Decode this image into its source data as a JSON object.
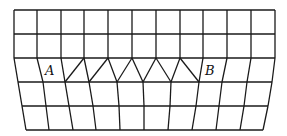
{
  "diagram": {
    "type": "mesh-grid",
    "labels": [
      {
        "id": "A",
        "text": "A",
        "x": 45,
        "y": 66
      },
      {
        "id": "B",
        "text": "B",
        "x": 205,
        "y": 66
      }
    ],
    "stroke_color": "#1a1a1a",
    "rows_y": [
      10,
      34,
      58,
      82,
      106,
      130
    ],
    "top_columns_x": [
      14,
      37,
      61,
      84,
      108,
      132,
      156,
      180,
      203,
      227,
      251,
      275
    ],
    "row82_x": [
      18,
      43,
      65,
      89,
      117,
      143,
      171,
      199,
      222,
      247,
      272
    ],
    "row106_x": [
      22,
      46,
      69,
      93,
      119,
      144,
      170,
      196,
      219,
      244,
      268
    ],
    "row130_x": [
      26,
      49,
      73,
      96,
      120,
      144,
      168,
      192,
      216,
      240,
      263
    ],
    "zigzag_apex_x": [
      84,
      108,
      132,
      156,
      180
    ],
    "zigzag_valley_x": [
      65,
      89,
      117,
      143,
      171,
      199
    ]
  }
}
